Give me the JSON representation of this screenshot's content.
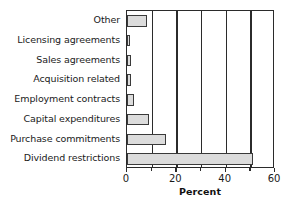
{
  "chart_data": {
    "type": "bar",
    "orientation": "horizontal",
    "title": "",
    "xlabel": "Percent",
    "ylabel": "",
    "xlim": [
      0,
      60
    ],
    "xticks": [
      0,
      20,
      40,
      60
    ],
    "xtick_labels": [
      "0",
      "20",
      "40",
      "60"
    ],
    "gridlines_x": [
      10,
      20,
      30,
      40,
      50
    ],
    "grid": true,
    "legend": false,
    "categories": [
      "Other",
      "Licensing agreements",
      "Sales agreements",
      "Acquisition related",
      "Employment contracts",
      "Capital expenditures",
      "Purchase commitments",
      "Dividend restrictions"
    ],
    "values": [
      8,
      1.2,
      1.5,
      1.5,
      2.8,
      9,
      16,
      51
    ],
    "bar_fill_color": "#dcdcdc",
    "bar_edge_color": "#3a3a3a",
    "axis_color": "#2b2b2b",
    "background_color": "#ffffff"
  }
}
